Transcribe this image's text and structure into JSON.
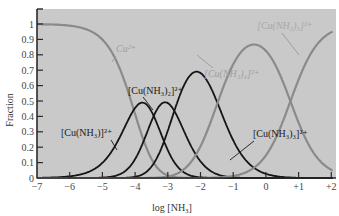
{
  "chart_data": {
    "type": "line",
    "title": "",
    "xlabel": "log [NH3]",
    "ylabel": "Fraction",
    "xlim": [
      -7,
      2
    ],
    "ylim": [
      0,
      1.05
    ],
    "grid": false,
    "legend": "inline labels",
    "x_ticks": [
      "-7",
      "-6",
      "-5",
      "-4",
      "-3",
      "-2",
      "-1",
      "0",
      "+1",
      "+2"
    ],
    "y_ticks": [
      "0",
      "0.1",
      "0.2",
      "0.3",
      "0.4",
      "0.5",
      "0.6",
      "0.7",
      "0.8",
      "0.9",
      "1"
    ],
    "log_beta": [
      0,
      4.04,
      7.47,
      10.27,
      11.75,
      11.0
    ],
    "series": [
      {
        "name": "Cu2+",
        "label": "Cu²⁺",
        "color": "#888888",
        "style": "gray",
        "peak_x": -7,
        "peak_y": 1.0
      },
      {
        "name": "[Cu(NH3)]2+",
        "label": "[Cu(NH₃)]²⁺",
        "color": "#111111",
        "style": "black",
        "peak_x": -3.9,
        "peak_y": 0.39
      },
      {
        "name": "[Cu(NH3)2]2+",
        "label": "[Cu(NH₃)₂]²⁺",
        "color": "#111111",
        "style": "black",
        "peak_x": -3.2,
        "peak_y": 0.49
      },
      {
        "name": "[Cu(NH3)3]2+",
        "label": "[Cu(NH₃)₃]²⁺",
        "color": "#111111",
        "style": "black",
        "peak_x": -2.5,
        "peak_y": 0.51
      },
      {
        "name": "[Cu(NH3)4]2+",
        "label": "[Cu(NH₃)₄]²⁺",
        "color": "#888888",
        "style": "gray",
        "peak_x": -0.3,
        "peak_y": 0.93
      },
      {
        "name": "[Cu(NH3)5]2+",
        "label": "[Cu(NH₃)₅]²⁺",
        "color": "#888888",
        "style": "gray",
        "peak_x": 2,
        "peak_y": 0.95
      }
    ],
    "annotations": [
      {
        "text": "Cu²⁺",
        "x": -4.9,
        "y": 0.86
      },
      {
        "text": "[Cu(NH₃)₅]²⁺",
        "x": 1.0,
        "y": 0.99
      },
      {
        "text": "[Cu(NH₃)₄]²⁺",
        "x": -0.9,
        "y": 0.7
      },
      {
        "text": "[Cu(NH₃)₂]²⁺",
        "x": -3.2,
        "y": 0.58
      },
      {
        "text": "[Cu(NH₃)]²⁺",
        "x": -5.0,
        "y": 0.35
      },
      {
        "text": "[Cu(NH₃)₃]²⁺",
        "x": -1.3,
        "y": 0.33
      }
    ]
  },
  "colors": {
    "plot_bg": "#c9c9c9",
    "gray_curve": "#8a8a8a",
    "black_curve": "#151515",
    "axis": "#2a2a2a"
  },
  "labels": {
    "ylabel": "Fraction",
    "xlabel_prefix": "log [NH",
    "xlabel_sub": "3",
    "xlabel_suffix": "]"
  }
}
